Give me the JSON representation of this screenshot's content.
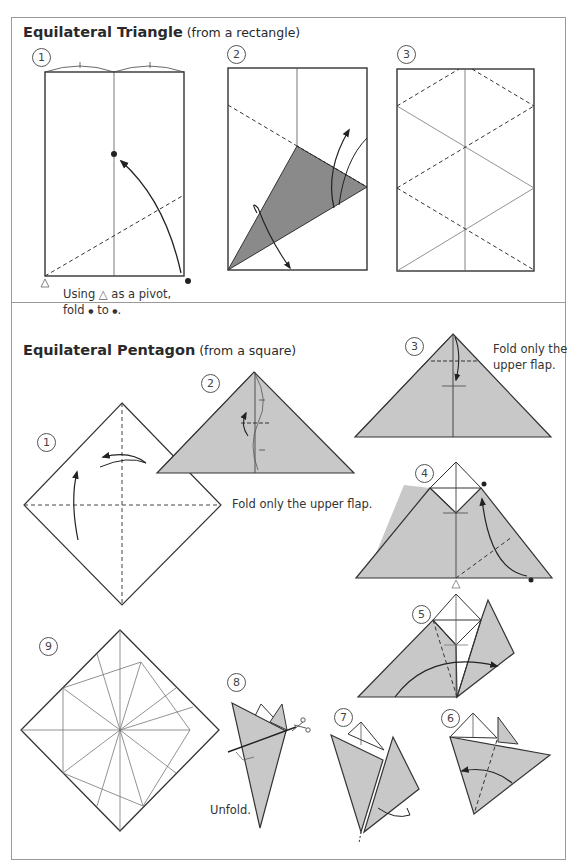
{
  "triangle_section": {
    "title_bold": "Equilateral Triangle",
    "title_sub": " (from a rectangle)",
    "steps": [
      {
        "number": "1"
      },
      {
        "number": "2"
      },
      {
        "number": "3"
      }
    ],
    "caption_line1_a": "Using ",
    "caption_pivot_symbol": "△",
    "caption_line1_b": " as a pivot,",
    "caption_line2_a": "fold ",
    "caption_dot_symbol": "●",
    "caption_line2_b": " to ",
    "caption_line2_c": "."
  },
  "pentagon_section": {
    "title_bold": "Equilateral Pentagon",
    "title_sub": " (from a square)",
    "steps": [
      {
        "number": "1"
      },
      {
        "number": "2",
        "caption": "Fold only the upper flap."
      },
      {
        "number": "3",
        "caption_line1": "Fold only the",
        "caption_line2": "upper flap."
      },
      {
        "number": "4"
      },
      {
        "number": "5"
      },
      {
        "number": "6"
      },
      {
        "number": "7"
      },
      {
        "number": "8",
        "caption": "Unfold."
      },
      {
        "number": "9"
      }
    ]
  },
  "colors": {
    "paper_shaded": "#c8c8c8",
    "paper_dark": "#8a8a8a",
    "line": "#333333",
    "frame": "#9a9a9a"
  }
}
